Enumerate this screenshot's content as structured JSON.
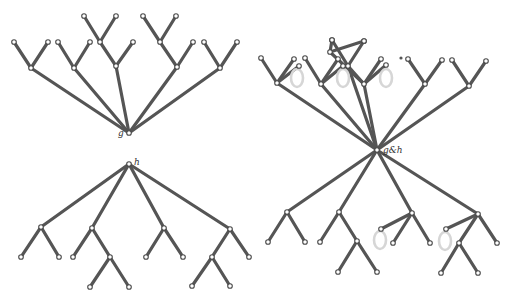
{
  "figure": {
    "trees": [
      {
        "id": "tree-g",
        "root_label": "g",
        "children": [
          {
            "children": [
              {},
              {}
            ]
          },
          {
            "children": [
              {},
              {}
            ]
          },
          {
            "children": [
              {
                "children": [
                  {},
                  {}
                ]
              },
              {}
            ]
          },
          {
            "children": [
              {
                "children": [
                  {},
                  {}
                ]
              },
              {}
            ]
          },
          {
            "children": [
              {},
              {}
            ]
          }
        ]
      },
      {
        "id": "tree-h",
        "root_label": "h",
        "children": [
          {
            "children": [
              {},
              {}
            ]
          },
          {
            "children": [
              {},
              {
                "children": [
                  {},
                  {}
                ]
              }
            ]
          },
          {
            "children": [
              {},
              {}
            ]
          },
          {
            "children": [
              {
                "children": [
                  {},
                  {}
                ]
              },
              {}
            ]
          }
        ]
      },
      {
        "id": "tree-g-and-h",
        "root_label": "g&h",
        "note": "merged tree; faint grey loops mark identified leaf pairs",
        "loop_count": 5
      }
    ]
  },
  "colors": {
    "edge": "#555555",
    "node_stroke": "#4a4a4a",
    "loop": "#d6d6d6"
  }
}
